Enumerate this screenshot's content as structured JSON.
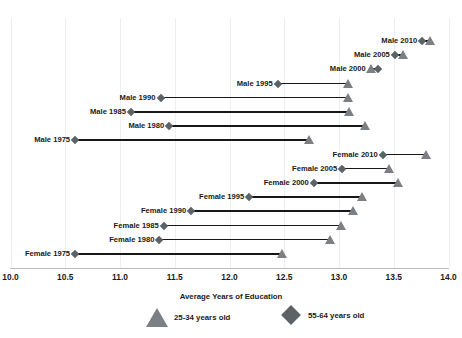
{
  "chart_data": {
    "type": "scatter",
    "subtype": "dumbbell",
    "title": "",
    "xlabel": "Average Years of Education",
    "ylabel": "",
    "xlim": [
      10.0,
      14.0
    ],
    "xticks": [
      "10.0",
      "10.5",
      "11.0",
      "11.5",
      "12.0",
      "12.5",
      "13.0",
      "13.5",
      "14.0"
    ],
    "grid": "vertical",
    "legend_position": "bottom",
    "legend": [
      {
        "label": "25-34 years old",
        "marker": "triangle",
        "color": "#7c7f83"
      },
      {
        "label": "55-64 years old",
        "marker": "diamond",
        "color": "#5d6266"
      }
    ],
    "series": [
      {
        "name": "25-34 years old",
        "marker": "triangle"
      },
      {
        "name": "55-64 years old",
        "marker": "diamond"
      }
    ],
    "categories": [
      "Male 2010",
      "Male 2005",
      "Male 2000",
      "Male 1995",
      "Male 1990",
      "Male 1985",
      "Male 1980",
      "Male 1975",
      "Female 2010",
      "Female 2005",
      "Female 2000",
      "Female 1995",
      "Female 1990",
      "Female 1985",
      "Female 1980",
      "Female 1975"
    ],
    "rows": [
      {
        "label": "Male 2010",
        "young": 13.83,
        "old": 13.76
      },
      {
        "label": "Male 2005",
        "young": 13.58,
        "old": 13.51
      },
      {
        "label": "Male 2000",
        "young": 13.29,
        "old": 13.36
      },
      {
        "label": "Male 1995",
        "young": 13.08,
        "old": 12.44
      },
      {
        "label": "Male 1990",
        "young": 13.08,
        "old": 11.37
      },
      {
        "label": "Male 1985",
        "young": 13.09,
        "old": 11.1
      },
      {
        "label": "Male 1980",
        "young": 13.24,
        "old": 11.45
      },
      {
        "label": "Male 1975",
        "young": 12.73,
        "old": 10.59
      },
      {
        "label": "Female 2010",
        "young": 13.79,
        "old": 13.4
      },
      {
        "label": "Female 2005",
        "young": 13.46,
        "old": 13.03
      },
      {
        "label": "Female 2000",
        "young": 13.54,
        "old": 12.77
      },
      {
        "label": "Female 1995",
        "young": 13.21,
        "old": 12.18
      },
      {
        "label": "Female 1990",
        "young": 13.13,
        "old": 11.65
      },
      {
        "label": "Female 1985",
        "young": 13.02,
        "old": 11.4
      },
      {
        "label": "Female 1980",
        "young": 12.92,
        "old": 11.36
      },
      {
        "label": "Female 1975",
        "young": 12.48,
        "old": 10.59
      }
    ]
  },
  "geometry": {
    "x_left_px": 10.5,
    "x_right_px": 448.5,
    "row_top_px": 34,
    "row_step_px": 14.2
  }
}
